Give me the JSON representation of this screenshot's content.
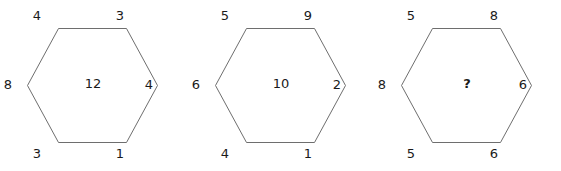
{
  "puzzle": {
    "type": "hexagon-number-puzzle",
    "background_color": "#ffffff",
    "stroke_color": "#6e6e6e",
    "text_color": "#1a1a1a",
    "hexagons": [
      {
        "id": "hexagon-1",
        "corners": {
          "top_left": "4",
          "top_right": "3",
          "left": "8",
          "right": "4",
          "bottom_left": "3",
          "bottom_right": "1"
        },
        "center": "12",
        "center_is_unknown": false
      },
      {
        "id": "hexagon-2",
        "corners": {
          "top_left": "5",
          "top_right": "9",
          "left": "6",
          "right": "2",
          "bottom_left": "4",
          "bottom_right": "1"
        },
        "center": "10",
        "center_is_unknown": false
      },
      {
        "id": "hexagon-3",
        "corners": {
          "top_left": "5",
          "top_right": "8",
          "left": "8",
          "right": "6",
          "bottom_left": "5",
          "bottom_right": "6"
        },
        "center": "?",
        "center_is_unknown": true
      }
    ]
  }
}
